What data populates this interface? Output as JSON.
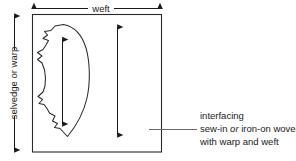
{
  "diagram": {
    "title_context": "fabric grain layout for interfacing pattern piece",
    "labels": {
      "weft": "weft",
      "selvedge_or_warp": "selvedge or warp"
    },
    "callout": {
      "heading": "interfacing",
      "line2_prefix": "sew-in ",
      "line2_emphasis": "or",
      "line2_suffix": " iron-on woven",
      "line3": "with warp and weft"
    },
    "colors": {
      "ink": "#1a1a1a",
      "rule": "#3a3a3a",
      "background": "#ffffff"
    },
    "arrows": {
      "weft_arrow_name": "horizontal-double-arrow",
      "warp_arrow_name": "vertical-double-arrow",
      "grainline_arrow_name": "grainline-double-arrow",
      "fabric_grain_arrow_name": "fabric-grain-double-arrow"
    }
  }
}
